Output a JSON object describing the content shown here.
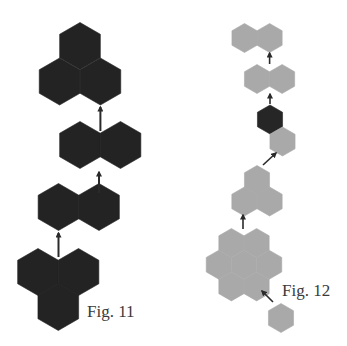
{
  "figures": [
    {
      "id": "fig11",
      "label": "Fig. 11",
      "hex_radius": 23.5,
      "clusters": [
        {
          "name": "cluster-triad-top",
          "color": "#232323",
          "hexes": [
            [
              80,
              46
            ],
            [
              59.6,
              81.5
            ],
            [
              100.4,
              81.5
            ]
          ]
        },
        {
          "name": "cluster-pair-upper",
          "color": "#232323",
          "hexes": [
            [
              80,
              145
            ],
            [
              120.5,
              145
            ]
          ]
        },
        {
          "name": "cluster-pair-lower",
          "color": "#232323",
          "hexes": [
            [
              58.5,
              207
            ],
            [
              99,
              207
            ]
          ]
        },
        {
          "name": "cluster-triad-bottom",
          "color": "#232323",
          "hexes": [
            [
              38,
              272
            ],
            [
              78.5,
              272
            ],
            [
              58.3,
              307
            ]
          ]
        }
      ],
      "arrows": [
        {
          "from": [
            100.4,
            131
          ],
          "to": [
            100.4,
            107
          ]
        },
        {
          "from": [
            99,
            193
          ],
          "to": [
            99,
            172
          ]
        },
        {
          "from": [
            58.5,
            257
          ],
          "to": [
            58.5,
            233
          ]
        }
      ]
    },
    {
      "id": "fig12",
      "label": "Fig. 12",
      "hex_radius": 14.5,
      "clusters": [
        {
          "name": "cluster-pair-top",
          "color": "#a9a9a9",
          "hexes": [
            [
              244.5,
              38
            ],
            [
              269.6,
              38
            ]
          ]
        },
        {
          "name": "cluster-pair-second",
          "color": "#a9a9a9",
          "hexes": [
            [
              257,
              79
            ],
            [
              282.1,
              79
            ]
          ]
        },
        {
          "name": "cluster-dark-single",
          "color": "#262626",
          "hexes": [
            [
              270,
              119.5
            ]
          ]
        },
        {
          "name": "cluster-light-single-mid",
          "color": "#a9a9a9",
          "hexes": [
            [
              282.5,
              141.5
            ]
          ]
        },
        {
          "name": "cluster-triad",
          "color": "#a9a9a9",
          "hexes": [
            [
              257,
              180
            ],
            [
              244.4,
              201.5
            ],
            [
              269.6,
              201.5
            ]
          ]
        },
        {
          "name": "cluster-flower-seven",
          "color": "#a9a9a9",
          "hexes": [
            [
              231.4,
              243
            ],
            [
              256.6,
              243
            ],
            [
              218.8,
              264.7
            ],
            [
              244,
              264.7
            ],
            [
              269.2,
              264.7
            ],
            [
              231.4,
              286.4
            ],
            [
              256.6,
              286.4
            ]
          ]
        },
        {
          "name": "cluster-single-bottom",
          "color": "#a9a9a9",
          "hexes": [
            [
              281,
              318
            ]
          ]
        }
      ],
      "arrows": [
        {
          "from": [
            269.6,
            64
          ],
          "to": [
            269.6,
            53
          ]
        },
        {
          "from": [
            270,
            104
          ],
          "to": [
            270,
            94
          ]
        },
        {
          "from": [
            263,
            165
          ],
          "to": [
            276,
            153
          ]
        },
        {
          "from": [
            243,
            229
          ],
          "to": [
            243,
            215
          ]
        },
        {
          "from": [
            273,
            302
          ],
          "to": [
            262,
            291
          ]
        }
      ]
    }
  ],
  "colors": {
    "background": "#ffffff",
    "arrow": "#2a2a2a",
    "label": "#3a3a3a"
  }
}
